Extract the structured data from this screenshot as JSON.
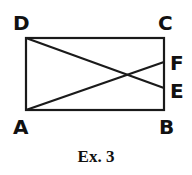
{
  "figure": {
    "caption": "Ex. 3",
    "stroke_color": "#1a1a1a",
    "points": {
      "A": {
        "label": "A",
        "x": 26,
        "y": 110
      },
      "B": {
        "label": "B",
        "x": 164,
        "y": 110
      },
      "C": {
        "label": "C",
        "x": 164,
        "y": 38
      },
      "D": {
        "label": "D",
        "x": 26,
        "y": 38
      },
      "E": {
        "label": "E",
        "x": 164,
        "y": 88
      },
      "F": {
        "label": "F",
        "x": 164,
        "y": 62
      }
    },
    "shapes": [
      {
        "type": "rectangle",
        "vertices": [
          "A",
          "B",
          "C",
          "D"
        ]
      },
      {
        "type": "segment",
        "from": "D",
        "to": "E"
      },
      {
        "type": "segment",
        "from": "A",
        "to": "F"
      }
    ]
  }
}
